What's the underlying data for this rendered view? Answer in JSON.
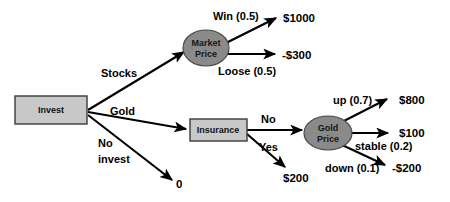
{
  "diagram": {
    "colors": {
      "decision_node_fill": "#c8c8c8",
      "decision_node_stroke": "#3a3a3a",
      "chance_node_fill": "#8a8a8a",
      "chance_node_stroke": "#4a4a4a",
      "edge": "#000000",
      "background": "#ffffff"
    },
    "nodes": {
      "invest": {
        "label": "Invest",
        "type": "decision"
      },
      "market_price": {
        "label_line1": "Market",
        "label_line2": "Price",
        "type": "chance"
      },
      "insurance": {
        "label": "Insurance",
        "type": "decision"
      },
      "gold_price": {
        "label_line1": "Gold",
        "label_line2": "Price",
        "type": "chance"
      }
    },
    "edge_labels": {
      "stocks": "Stocks",
      "gold": "Gold",
      "no_invest_line1": "No",
      "no_invest_line2": "invest",
      "win": "Win (0.5)",
      "loose": "Loose (0.5)",
      "no": "No",
      "yes": "Yes",
      "up": "up (0.7)",
      "stable": "stable (0.2)",
      "down": "down (0.1)"
    },
    "payoffs": {
      "win": "$1000",
      "loose": "-$300",
      "no_invest": "0",
      "insurance_yes": "$200",
      "gold_up": "$800",
      "gold_stable": "$100",
      "gold_down": "-$200"
    }
  }
}
